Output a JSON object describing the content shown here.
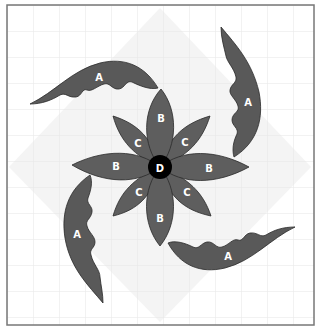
{
  "diagram": {
    "type": "quilt-block-pattern",
    "frame": {
      "x": 7,
      "y": 5,
      "width": 307,
      "height": 320,
      "border_color": "#777777"
    },
    "grid": {
      "spacing": 26,
      "line_color": "#e6e6e6"
    },
    "background_diamond_color": "#f3f3f3",
    "colors": {
      "petal_fill": "#5e5e5e",
      "leaf_fill": "#595959",
      "outline": "#2a2a2a",
      "center_fill": "#000000",
      "label_color": "#ffffff"
    },
    "pieces": {
      "A": {
        "label": "A",
        "count": 4,
        "description": "curved leaf"
      },
      "B": {
        "label": "B",
        "count": 4,
        "description": "long petal (cardinal)"
      },
      "C": {
        "label": "C",
        "count": 4,
        "description": "short petal (diagonal)"
      },
      "D": {
        "label": "D",
        "count": 1,
        "description": "center circle"
      }
    },
    "labels": {
      "leaf_top_left": "A",
      "leaf_top_right": "A",
      "leaf_bottom_left": "A",
      "leaf_bottom_right": "A",
      "petal_b_top": "B",
      "petal_b_left": "B",
      "petal_b_right": "B",
      "petal_b_bottom": "B",
      "petal_c_top_left": "C",
      "petal_c_top_right": "C",
      "petal_c_bottom_left": "C",
      "petal_c_bottom_right": "C",
      "center": "D"
    }
  }
}
